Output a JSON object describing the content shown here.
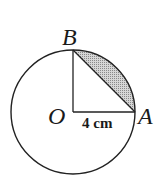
{
  "diagram": {
    "labels": {
      "center": "O",
      "point_a": "A",
      "point_b": "B"
    },
    "measurement": "4 cm",
    "colors": {
      "stroke": "#222222",
      "shade": "#bdbdbd"
    }
  }
}
